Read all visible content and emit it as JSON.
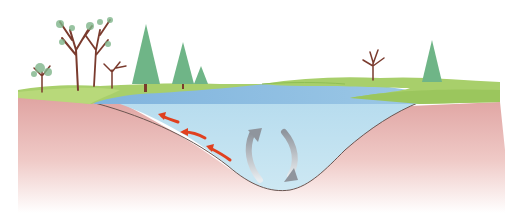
{
  "diagram": {
    "elements": {
      "surface_current_arrows": {
        "count": 3,
        "color": "#e0401f",
        "direction": "up-left along slope"
      },
      "circulation_arrows": {
        "count": 2,
        "color": "#9aa0a8",
        "direction": "circular"
      }
    },
    "colors": {
      "sky": "#ffffff",
      "grass": "#a6cf6a",
      "grass_dark": "#8fbf55",
      "water_surface": "#8fbde0",
      "water_body": "#bfe0ef",
      "soil": "#e0a8a8",
      "tree_trunk": "#7a3b2e",
      "pine": "#6fb587"
    }
  }
}
